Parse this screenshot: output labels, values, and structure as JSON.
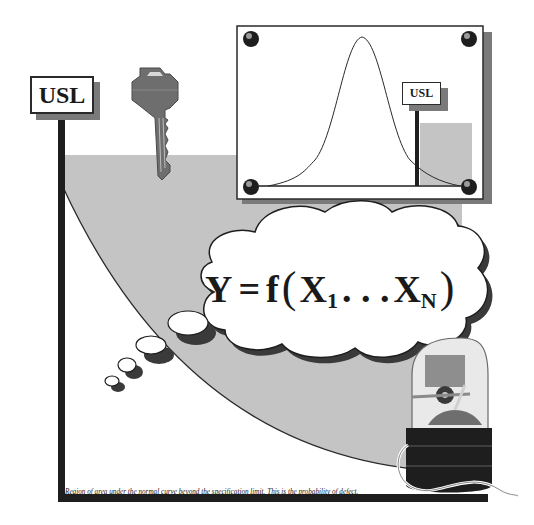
{
  "main_sign": {
    "label": "USL"
  },
  "chart_panel": {
    "sign_label": "USL",
    "curve_type": "normal distribution"
  },
  "thought_bubble": {
    "lhs": "Y",
    "equals": "=",
    "func": "f",
    "open_paren": "(",
    "x1_base": "X",
    "x1_sub": "1",
    "ellipsis": ". . .",
    "xn_base": "X",
    "xn_sub": "N",
    "close_paren": ")"
  },
  "caption": "Region of area under the normal curve beyond the specification  limit.  This is the probability of defect.",
  "icons": [
    "key-icon",
    "bell-jar-mechanism-icon",
    "pushpin-icon"
  ],
  "colors": {
    "shaded_region": "#c4c4c4",
    "frame_dark": "#1e1e1e",
    "shadow": "#7a7a7a",
    "panel_bg": "#ffffff"
  }
}
